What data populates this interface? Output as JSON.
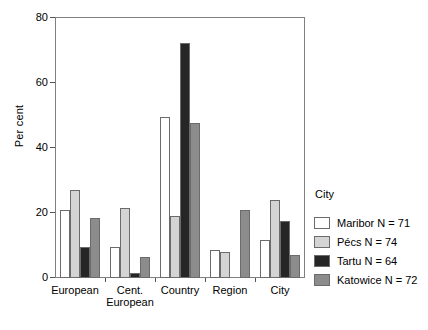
{
  "chart_data": {
    "type": "bar",
    "title": "",
    "xlabel": "",
    "ylabel": "Per cent",
    "ylim": [
      0,
      80
    ],
    "yticks": [
      0,
      20,
      40,
      60,
      80
    ],
    "grid": false,
    "legend_position": "right",
    "legend_title": "City",
    "categories": [
      "European",
      "Cent. European",
      "Country",
      "Region",
      "City"
    ],
    "category_lines": [
      [
        "European"
      ],
      [
        "Cent.",
        "European"
      ],
      [
        "Country"
      ],
      [
        "Region"
      ],
      [
        "City"
      ]
    ],
    "series": [
      {
        "name": "Maribor N = 71",
        "color": "#ffffff",
        "values": [
          21,
          9.5,
          49.5,
          8.5,
          11.5
        ]
      },
      {
        "name": "Pécs N = 74",
        "color": "#d4d4d4",
        "values": [
          27,
          21.5,
          19,
          8,
          24
        ]
      },
      {
        "name": "Tartu N = 64",
        "color": "#262626",
        "values": [
          9.5,
          1.5,
          72,
          0,
          17.5
        ]
      },
      {
        "name": "Katowice N = 72",
        "color": "#8c8c8c",
        "values": [
          18.5,
          6.5,
          47.5,
          21,
          7
        ]
      }
    ]
  },
  "axis": {
    "y_label": "Per cent",
    "y_tick_0": "0",
    "y_tick_20": "20",
    "y_tick_40": "40",
    "y_tick_60": "60",
    "y_tick_80": "80"
  },
  "x_labels": {
    "cat0_line1": "European",
    "cat1_line1": "Cent.",
    "cat1_line2": "European",
    "cat2_line1": "Country",
    "cat3_line1": "Region",
    "cat4_line1": "City"
  },
  "legend": {
    "title": "City",
    "items": [
      {
        "label": "Maribor N = 71",
        "color": "#ffffff"
      },
      {
        "label": "Pécs N = 74",
        "color": "#d4d4d4"
      },
      {
        "label": "Tartu N = 64",
        "color": "#262626"
      },
      {
        "label": "Katowice N = 72",
        "color": "#8c8c8c"
      }
    ]
  }
}
